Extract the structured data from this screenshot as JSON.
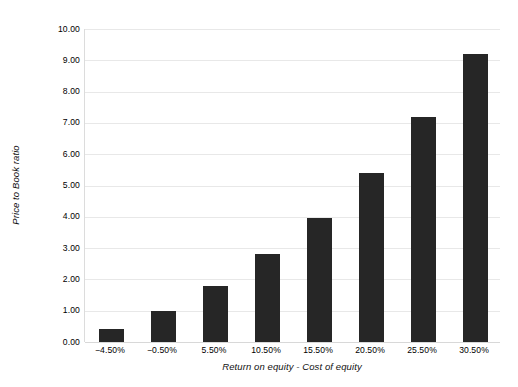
{
  "chart_data": {
    "type": "bar",
    "title": "",
    "xlabel": "Return on equity - Cost of equity",
    "ylabel": "Price to Book ratio",
    "categories": [
      "-4.50%",
      "-0.50%",
      "5.50%",
      "10.50%",
      "15.50%",
      "20.50%",
      "25.50%",
      "30.50%"
    ],
    "values": [
      0.4,
      1.0,
      1.8,
      2.8,
      3.95,
      5.4,
      7.2,
      9.2
    ],
    "ylim": [
      0.0,
      10.0
    ],
    "ytick_labels": [
      "0.00",
      "1.00",
      "2.00",
      "3.00",
      "4.00",
      "5.00",
      "6.00",
      "7.00",
      "8.00",
      "9.00",
      "10.00"
    ],
    "ytick_values": [
      0,
      1,
      2,
      3,
      4,
      5,
      6,
      7,
      8,
      9,
      10
    ],
    "grid": true,
    "legend": "none",
    "bar_color": "#262626",
    "grid_color": "#e8e8e8",
    "background_color": "#ffffff"
  }
}
